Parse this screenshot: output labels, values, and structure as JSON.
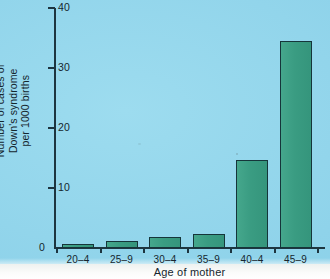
{
  "chart_data": {
    "type": "bar",
    "title": "",
    "xlabel": "Age of mother",
    "ylabel_lines": [
      "Number of cases of",
      "Down's syndrome",
      "per 1000 births"
    ],
    "ylabel": "Number of cases of Down's syndrome per 1000 births",
    "categories": [
      "20–4",
      "25–9",
      "30–4",
      "35–9",
      "40–4",
      "45–9"
    ],
    "values": [
      0.7,
      1.2,
      1.8,
      2.4,
      14.7,
      34.5
    ],
    "ylim": [
      0,
      40
    ],
    "yticks": [
      0,
      10,
      20,
      30,
      40
    ],
    "ytick_labels": [
      "0",
      "10",
      "20",
      "30",
      "40"
    ],
    "grid": false,
    "legend": false,
    "series": [
      {
        "name": "Down's syndrome cases per 1000 births",
        "values": [
          0.7,
          1.2,
          1.8,
          2.4,
          14.7,
          34.5
        ]
      }
    ]
  },
  "colors": {
    "background": "#8fd3ea",
    "paper": "#ffffff",
    "bar_fill": "#3a9c82",
    "bar_stroke": "#15353a",
    "axis": "#1d3540",
    "text": "#15262e"
  }
}
